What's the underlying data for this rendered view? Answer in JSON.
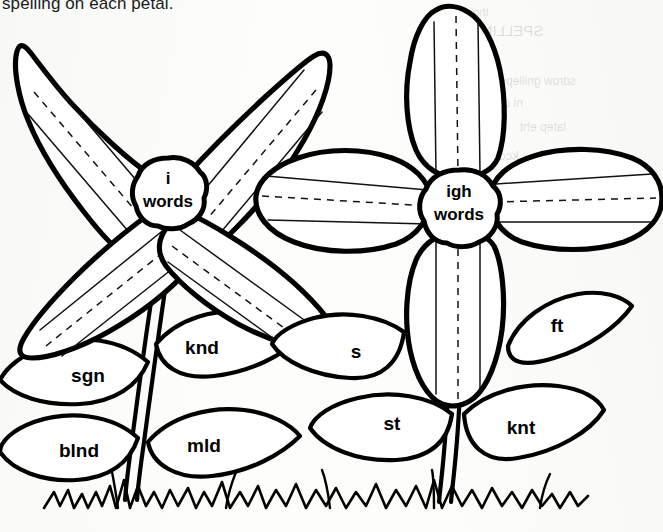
{
  "worksheet": {
    "instruction_text": "spelling on each petal.",
    "ink_color": "#000000",
    "paper_color": "#fdfdfb"
  },
  "bleed_through": [
    {
      "text": "thgir eht ni",
      "x": 437,
      "y": 6,
      "size": 11
    },
    {
      "text": "SPELLING",
      "x": 470,
      "y": 22,
      "size": 15
    },
    {
      "text": "eht etirw",
      "x": 430,
      "y": 52,
      "size": 12
    },
    {
      "text": "sdrow gnilleps",
      "x": 500,
      "y": 74,
      "size": 12
    },
    {
      "text": "ni drow hcae",
      "x": 455,
      "y": 96,
      "size": 12
    },
    {
      "text": "latep eht",
      "x": 520,
      "y": 120,
      "size": 12
    },
    {
      "text": "kcolb retsam",
      "x": 445,
      "y": 148,
      "size": 13
    },
    {
      "text": "tinu",
      "x": 560,
      "y": 176,
      "size": 12
    },
    {
      "text": "gnidaer",
      "x": 470,
      "y": 206,
      "size": 12
    },
    {
      "text": "srettel",
      "x": 530,
      "y": 236,
      "size": 11
    }
  ],
  "flowers": [
    {
      "id": "left-flower",
      "center_label_line1": "i",
      "center_label_line2": "words",
      "center_x": 168,
      "center_y": 192,
      "petal_arrangement": "diagonal-x",
      "petal_count": 4,
      "petals": [
        {
          "position": "upper-left",
          "guide_lines": 3
        },
        {
          "position": "upper-right",
          "guide_lines": 3
        },
        {
          "position": "lower-left",
          "guide_lines": 3
        },
        {
          "position": "lower-right",
          "guide_lines": 3
        }
      ],
      "leaves": [
        {
          "label": "knd",
          "side": "right",
          "x": 202,
          "y": 349
        },
        {
          "label": "sgn",
          "side": "left",
          "x": 88,
          "y": 377
        },
        {
          "label": "mld",
          "side": "right",
          "x": 204,
          "y": 447
        },
        {
          "label": "blnd",
          "side": "left",
          "x": 79,
          "y": 452
        }
      ]
    },
    {
      "id": "right-flower",
      "center_label_line1": "igh",
      "center_label_line2": "words",
      "center_x": 459,
      "center_y": 205,
      "petal_arrangement": "cross-plus",
      "petal_count": 4,
      "petals": [
        {
          "position": "top",
          "guide_lines": 3
        },
        {
          "position": "left",
          "guide_lines": 3
        },
        {
          "position": "right",
          "guide_lines": 3
        },
        {
          "position": "bottom",
          "guide_lines": 3
        }
      ],
      "leaves": [
        {
          "label": "s",
          "side": "left",
          "x": 356,
          "y": 353
        },
        {
          "label": "ft",
          "side": "right",
          "x": 557,
          "y": 327
        },
        {
          "label": "st",
          "side": "left",
          "x": 392,
          "y": 425
        },
        {
          "label": "knt",
          "side": "right",
          "x": 521,
          "y": 429
        }
      ]
    }
  ],
  "ground": {
    "label": "grass-line",
    "x_start": 40,
    "x_end": 592,
    "y": 498
  }
}
